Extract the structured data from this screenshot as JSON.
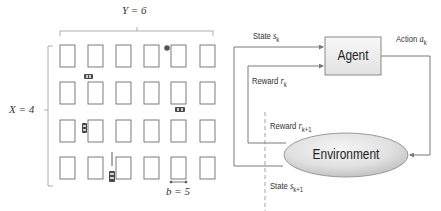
{
  "grid_panel": {
    "y_label": "Y = 6",
    "x_label": "X = 4",
    "b_label": "b = 5",
    "columns": 6,
    "rows": 4,
    "column_x": [
      60,
      88,
      116,
      144,
      171,
      200
    ],
    "row_y": [
      45,
      82,
      120,
      157
    ],
    "cell_width": 15,
    "cell_height": 22,
    "vehicles": [
      {
        "orientation": "horizontal",
        "x": 84,
        "y": 74
      },
      {
        "orientation": "horizontal",
        "x": 175,
        "y": 107
      },
      {
        "orientation": "vertical",
        "x": 82,
        "y": 124
      },
      {
        "orientation": "vertical",
        "x": 109,
        "y": 170
      }
    ],
    "markers": [
      {
        "type": "circle",
        "x": 167,
        "y": 47
      }
    ]
  },
  "rl_loop": {
    "agent_label": "Agent",
    "environment_label": "Environment",
    "state_label": "State",
    "state_symbol": "s",
    "state_sub": "k",
    "reward_label": "Reward",
    "reward_symbol": "r",
    "reward_sub": "k",
    "action_label": "Action",
    "action_symbol": "a",
    "action_sub": "k",
    "next_reward_label": "Reward",
    "next_reward_symbol": "r",
    "next_reward_sub": "k+1",
    "next_state_label": "State",
    "next_state_symbol": "s",
    "next_state_sub": "k+1"
  },
  "colors": {
    "line": "#7a7a7a",
    "cell_stroke": "#6e6e6e",
    "agent_fill_top": "#f7f7f7",
    "agent_fill_bottom": "#e4e4e4",
    "env_fill_light": "#f2f2f2",
    "env_fill_dark": "#c8c8c8",
    "vehicle": "#4a4a4a",
    "marker": "#555555"
  }
}
